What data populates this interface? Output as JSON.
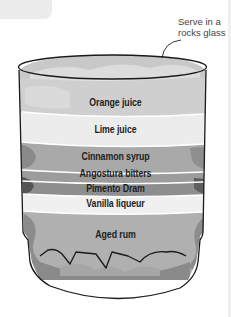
{
  "diagram": {
    "type": "layered-cocktail-glass",
    "callout": {
      "line1": "Serve in a",
      "line2": "rocks glass"
    },
    "layers": [
      {
        "label": "Orange juice",
        "color": "#cfcfcf"
      },
      {
        "label": "Lime juice",
        "color": "#ececec"
      },
      {
        "label": "Cinnamon syrup",
        "color": "#a9a9a9"
      },
      {
        "label": "Angostura bitters",
        "color": "#9c9c9c"
      },
      {
        "label": "Pimento Dram",
        "color": "#8e8e8e"
      },
      {
        "label": "Vanilla liqueur",
        "color": "#f0f0f0"
      },
      {
        "label": "Aged rum",
        "color": "#b0b0b0"
      }
    ]
  }
}
